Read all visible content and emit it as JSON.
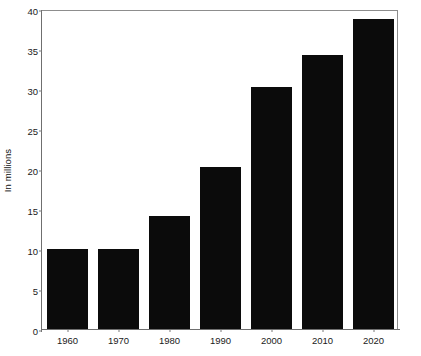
{
  "chart_data": {
    "type": "bar",
    "title": "",
    "subtitle": "",
    "xlabel": "",
    "ylabel": "In millions",
    "categories": [
      "1960",
      "1970",
      "1980",
      "1990",
      "2000",
      "2010",
      "2020"
    ],
    "values": [
      10.0,
      10.0,
      14.1,
      20.3,
      30.3,
      34.3,
      38.8
    ],
    "series": [
      {
        "name": "",
        "values": [
          10.0,
          10.0,
          14.1,
          20.3,
          30.3,
          34.3,
          38.8
        ]
      }
    ],
    "ylim": [
      0,
      40
    ],
    "yticks": [
      0,
      5,
      10,
      15,
      20,
      25,
      30,
      35,
      40
    ],
    "ytick_labels": [
      "0",
      "5",
      "10",
      "15",
      "20",
      "25",
      "30",
      "35",
      "40"
    ],
    "xtick_labels": [
      "1960",
      "1970",
      "1980",
      "1990",
      "2000",
      "2010",
      "2020"
    ],
    "grid": false,
    "legend": false,
    "legend_position": "none",
    "bar_color": "#0b0b0b",
    "background_color": "#ffffff",
    "frame_color": "#8d8d8d",
    "annotations": []
  }
}
